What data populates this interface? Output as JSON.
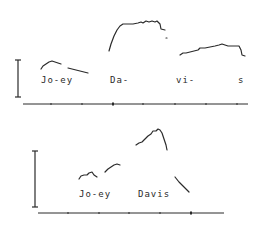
{
  "diagram": {
    "type": "pitch-contour-comparison",
    "ink_color": "#2a2a2a",
    "panels": [
      {
        "id": "top",
        "syllable_labels": [
          {
            "text": "Jo-ey",
            "x": 41,
            "y": 81
          },
          {
            "text": "Da-",
            "x": 110,
            "y": 81
          },
          {
            "text": "vi-",
            "x": 176,
            "y": 81
          },
          {
            "text": "s",
            "x": 238,
            "y": 81
          }
        ],
        "scale_bar": {
          "x": 18,
          "y1": 60,
          "y2": 97
        },
        "time_axis": {
          "x1": 23,
          "x2": 248,
          "y": 104,
          "ticks": [
            51,
            82,
            113,
            143,
            175,
            206,
            237
          ]
        },
        "contours": [
          "M41,69 L43,66 L46,64 L49,62 L52,61 L55,62 L58,63 L61,64",
          "M68,68 L72,69 L76,70 L80,71 L84,72 L88,73",
          "M109,51 L111,44 L114,36 L117,30 L120,26 L123,24 L128,24 L133,24 L138,23 L141,22 L143,23 L146,21 L149,22 L152,21 L155,22 L157,21 L160,24 L161,29 L165,30",
          "M166,38 L167,38",
          "M180,55 L183,53 L186,53 L190,52 L194,51 L198,50 L200,48 L205,48 L210,47 L215,46 L219,45 L222,44 L225,45 L228,46 L232,46 L239,46 L241,50 L242,55 L245,56"
        ]
      },
      {
        "id": "bottom",
        "syllable_labels": [
          {
            "text": "Jo-ey",
            "x": 79,
            "y": 76
          },
          {
            "text": "Davis",
            "x": 138,
            "y": 76
          }
        ],
        "scale_bar": {
          "x": 35,
          "y1": 33,
          "y2": 89
        },
        "time_axis": {
          "x1": 38,
          "x2": 224,
          "y": 95,
          "ticks": [
            68,
            99,
            129,
            160,
            191
          ]
        },
        "contours": [
          "M79,61 L81,58 L84,57 L87,57 L89,55 L92,54 L94,57 L97,59",
          "M105,54 L108,51 L111,49 L114,47 L117,46 L120,47",
          "M136,27 L139,25 L142,24 L145,21 L148,18 L151,16 L153,13 L156,13 L158,11 L160,12 L162,15 L164,21 L166,27 L167,32",
          "M175,59 L179,64 L183,68 L187,72 L189,74"
        ]
      }
    ]
  }
}
